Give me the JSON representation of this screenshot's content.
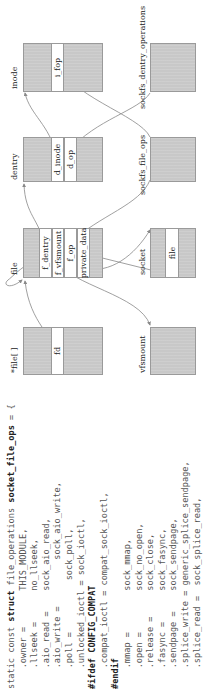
{
  "code": {
    "lines": [
      {
        "pre": "static const ",
        "kw": "struct",
        "post": " file_operations ",
        "name": "socket_file_ops",
        "tail": " = {"
      },
      {
        "text": "    .owner =       THIS_MODULE,"
      },
      {
        "text": "    .llseek =      no_llseek,"
      },
      {
        "text": "    .aio_read =    sock_aio_read,"
      },
      {
        "text": "    .aio_write =         sock_aio_write,"
      },
      {
        "text": "    .poll =          sock_poll,"
      },
      {
        "text": "    .unlocked_ioctl = sock_ioctl,"
      },
      {
        "directive": "#ifdef CONFIG_COMPAT"
      },
      {
        "text": "    .compat_ioctl = compat_sock_ioctl,"
      },
      {
        "directive": "#endif"
      },
      {
        "text": "    .mmap =        sock_mmap,"
      },
      {
        "text": "    .open =        sock_no_open,"
      },
      {
        "text": "    .release =     sock_close,"
      },
      {
        "text": "    .fasync =      sock_fasync,"
      },
      {
        "text": "    .sendpage =    sock_sendpage,"
      },
      {
        "text": "    .splice_write = generic_splice_sendpage,"
      },
      {
        "text": "    .splice_read =  sock_splice_read,"
      },
      {
        "text": ""
      },
      {
        "text": "};"
      }
    ]
  },
  "diagram": {
    "nodes": {
      "file_array": {
        "label": "*file[ ]",
        "fields": [
          "fd"
        ]
      },
      "vfsmount": {
        "label": "vfsmount",
        "fields": []
      },
      "file": {
        "label": "file",
        "fields": [
          "f_dentry",
          "f_vfsmount",
          "f_op",
          "private_data"
        ]
      },
      "socket": {
        "label": "socket",
        "fields": [
          "file"
        ]
      },
      "dentry": {
        "label": "dentry",
        "fields": [
          "d_inode",
          "d_op"
        ]
      },
      "sockfs_file_ops": {
        "label": "sockfs_file_ops",
        "fields": []
      },
      "inode": {
        "label": "inode",
        "fields": [
          "i_fop"
        ]
      },
      "sockfs_dentry_operations": {
        "label": "sockfs_dentry_operations",
        "fields": []
      }
    },
    "edges": [
      {
        "from": "fd",
        "to": "file"
      },
      {
        "from": "f_dentry",
        "to": "dentry"
      },
      {
        "from": "f_vfsmount",
        "to": "vfsmount"
      },
      {
        "from": "f_op",
        "to": "sockfs_file_ops"
      },
      {
        "from": "private_data",
        "to": "socket"
      },
      {
        "from": "socket.file",
        "to": "file"
      },
      {
        "from": "d_inode",
        "to": "inode"
      },
      {
        "from": "d_op",
        "to": "sockfs_dentry_operations"
      },
      {
        "from": "i_fop",
        "to": "sockfs_file_ops"
      }
    ],
    "colors": {
      "box": "#c8c8c8",
      "field": "#ffffff",
      "border": "#9a9a9a",
      "line": "#888888"
    }
  }
}
